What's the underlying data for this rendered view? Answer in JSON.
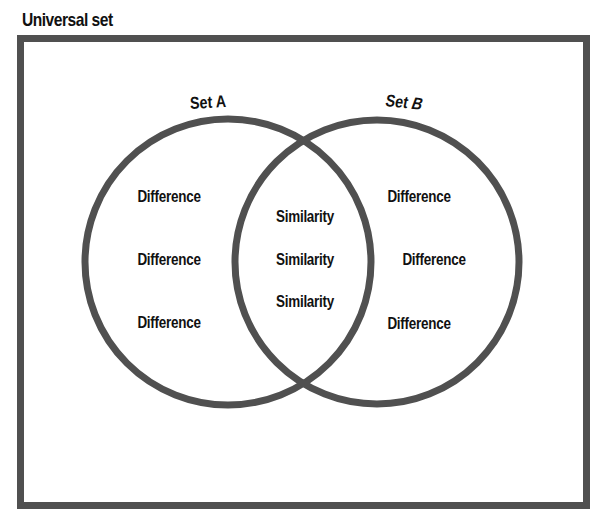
{
  "diagram": {
    "type": "venn",
    "clipped_title_fragment": "g",
    "universal_set_label": "Universal set",
    "colors": {
      "stroke": "#505050",
      "text": "#111111",
      "background": "#ffffff"
    },
    "sets": [
      {
        "name": "Set A",
        "label_prefix": "Set",
        "label_letter": "A",
        "circle": {
          "cx": 228,
          "cy": 262,
          "r": 143
        }
      },
      {
        "name": "Set B",
        "label_prefix": "Set",
        "label_letter": "B",
        "circle": {
          "cx": 377,
          "cy": 262,
          "r": 142
        }
      }
    ],
    "regions": {
      "a_only": [
        "Difference",
        "Difference",
        "Difference"
      ],
      "intersection": [
        "Similarity",
        "Similarity",
        "Similarity"
      ],
      "b_only": [
        "Difference",
        "Difference",
        "Difference"
      ]
    }
  }
}
